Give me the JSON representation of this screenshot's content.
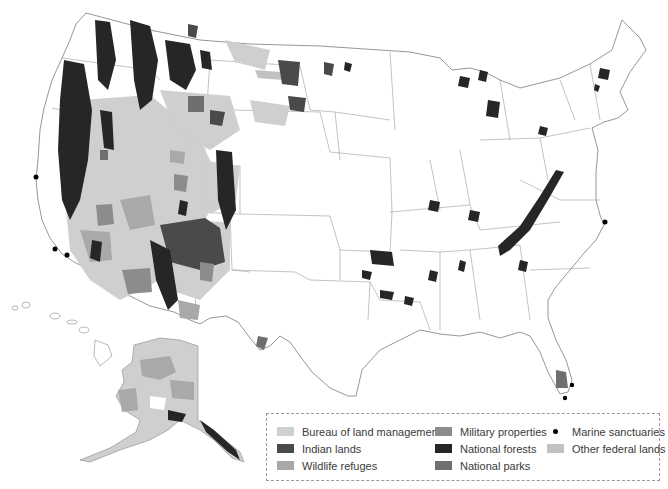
{
  "map": {
    "title": "Federal lands of the United States",
    "colors": {
      "state_border": "#8a8a8a",
      "blm": "#cfcfcf",
      "indian_lands": "#4a4a4a",
      "wildlife_refuges": "#a9a9a9",
      "military": "#8c8c8c",
      "national_forests": "#262626",
      "national_parks": "#6f6f6f",
      "marine_sanctuaries": "#000000",
      "other_federal": "#c2c2c2"
    },
    "marine_sanctuaries_points": [
      {
        "x": 36,
        "y": 177,
        "label": "Cordell Bank / Gulf of the Farallones"
      },
      {
        "x": 55,
        "y": 249,
        "label": "Channel Islands"
      },
      {
        "x": 67,
        "y": 255,
        "label": "Channel Islands south"
      },
      {
        "x": 605,
        "y": 222,
        "label": "Monitor"
      },
      {
        "x": 572,
        "y": 385,
        "label": "Florida Keys north"
      },
      {
        "x": 565,
        "y": 398,
        "label": "Florida Keys"
      }
    ]
  },
  "legend": {
    "items": [
      {
        "label": "Bureau of land management",
        "color": "#cfcfcf"
      },
      {
        "label": "Indian lands",
        "color": "#4a4a4a"
      },
      {
        "label": "Wildlife refuges",
        "color": "#a9a9a9"
      },
      {
        "label": "Military properties",
        "color": "#8c8c8c"
      },
      {
        "label": "National forests",
        "color": "#262626"
      },
      {
        "label": "National parks",
        "color": "#6f6f6f"
      },
      {
        "label": "Marine sanctuaries",
        "color": "#000000"
      },
      {
        "label": "Other federal lands",
        "color": "#c2c2c2"
      }
    ]
  }
}
